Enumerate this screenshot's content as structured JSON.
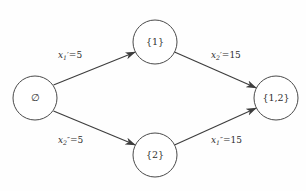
{
  "diagram": {
    "type": "state-transition-lattice",
    "background_color": "#fefefe",
    "stroke_color": "#3d3d3d",
    "nodes": [
      {
        "id": "empty",
        "label": "∅",
        "cx": 35,
        "cy": 98,
        "r": 22
      },
      {
        "id": "one",
        "label": "{1}",
        "cx": 155,
        "cy": 42,
        "r": 22
      },
      {
        "id": "two",
        "label": "{2}",
        "cx": 155,
        "cy": 155,
        "r": 22
      },
      {
        "id": "onetwo",
        "label": "{1,2}",
        "cx": 276,
        "cy": 98,
        "r": 22
      }
    ],
    "edges": [
      {
        "id": "empty-to-one",
        "from": "empty",
        "to": "one",
        "label": {
          "var": "x",
          "sub": "1",
          "prime": "′",
          "eq": "=",
          "value": "5"
        },
        "label_text": "x₁′=5"
      },
      {
        "id": "one-to-onetwo",
        "from": "one",
        "to": "onetwo",
        "label": {
          "var": "x",
          "sub": "2",
          "prime": "′",
          "eq": "=",
          "value": "15"
        },
        "label_text": "x₂′=15"
      },
      {
        "id": "empty-to-two",
        "from": "empty",
        "to": "two",
        "label": {
          "var": "x",
          "sub": "2",
          "prime": "″",
          "eq": "=",
          "value": "5"
        },
        "label_text": "x₂″=5"
      },
      {
        "id": "two-to-onetwo",
        "from": "two",
        "to": "onetwo",
        "label": {
          "var": "x",
          "sub": "1",
          "prime": "″",
          "eq": "=",
          "value": "15"
        },
        "label_text": "x₁″=15"
      }
    ]
  }
}
